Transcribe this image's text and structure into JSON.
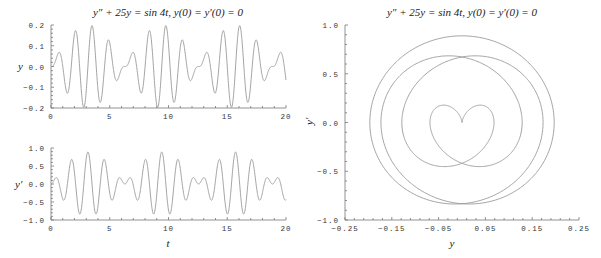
{
  "chart_data": [
    {
      "type": "line",
      "title": "y'' + 25y = sin 4t,    y(0) = y'(0) = 0",
      "xlabel": "",
      "ylabel": "y",
      "xlim": [
        0,
        20
      ],
      "ylim": [
        -0.2,
        0.2
      ],
      "xticks": [
        "0",
        "5",
        "10",
        "15",
        "20"
      ],
      "yticks": [
        "0.2",
        "0.1",
        "0.0",
        "-0.1",
        "-0.2"
      ],
      "series": [
        {
          "name": "y(t)",
          "formula": "(5*sin(4t) - 4*sin(5t))/45"
        }
      ],
      "grid": false
    },
    {
      "type": "line",
      "title": "",
      "xlabel": "t",
      "ylabel": "y'",
      "xlim": [
        0,
        20
      ],
      "ylim": [
        -1.0,
        1.0
      ],
      "xticks": [
        "0",
        "5",
        "10",
        "15",
        "20"
      ],
      "yticks": [
        "1.0",
        "0.5",
        "0.0",
        "-0.5",
        "-1.0"
      ],
      "series": [
        {
          "name": "y'(t)",
          "formula": "(20*cos(4t) - 20*cos(5t))/45"
        }
      ],
      "grid": false
    },
    {
      "type": "line",
      "title": "y'' + 25y = sin 4t,    y(0) = y'(0) = 0",
      "xlabel": "y",
      "ylabel": "y'",
      "xlim": [
        -0.25,
        0.25
      ],
      "ylim": [
        -1.0,
        1.0
      ],
      "xticks": [
        "-0.25",
        "-0.15",
        "-0.05",
        "0.05",
        "0.15",
        "0.25"
      ],
      "yticks": [
        "1.0",
        "0.5",
        "0.0",
        "-0.5",
        "-1.0"
      ],
      "series": [
        {
          "name": "phase portrait (y, y')",
          "t_range": [
            0,
            6.2832
          ]
        }
      ],
      "grid": false
    }
  ],
  "titles": {
    "left": "y″ + 25y = sin 4t,    y(0) = y′(0) = 0",
    "right": "y″ + 25y = sin 4t,    y(0) = y′(0) = 0"
  },
  "labels": {
    "top_y": "y",
    "bottom_y": "y′",
    "bottom_x": "t",
    "right_x": "y",
    "right_y": "y′"
  }
}
